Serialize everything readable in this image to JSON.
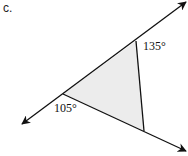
{
  "problem_label": "c.",
  "diagram": {
    "shape": "triangle",
    "fill_color": "#ececec",
    "line_color": "#111111",
    "vertices": {
      "top": [
        136,
        41
      ],
      "left": [
        63,
        94
      ],
      "bottom": [
        144,
        131
      ]
    },
    "lines": [
      {
        "name": "upper-line",
        "from": [
          22,
          124
        ],
        "to": [
          186,
          2
        ],
        "arrows": "both"
      },
      {
        "name": "lower-line",
        "from": [
          63,
          94
        ],
        "to": [
          186,
          151
        ],
        "arrows": "end"
      },
      {
        "name": "side-segment",
        "from": [
          136,
          41
        ],
        "to": [
          144,
          131
        ],
        "arrows": "none"
      }
    ],
    "angles": [
      {
        "label": "135°",
        "value": 135,
        "position": "exterior at top vertex"
      },
      {
        "label": "105°",
        "value": 105,
        "position": "exterior at left vertex"
      }
    ]
  }
}
